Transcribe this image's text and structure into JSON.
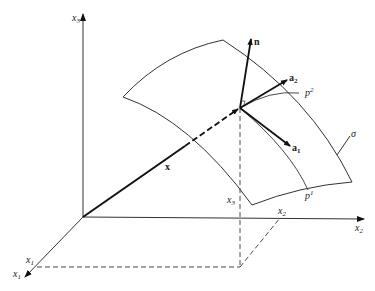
{
  "diagram": {
    "type": "surface-coordinate-geometry",
    "axes": {
      "x1": {
        "label": "x",
        "sub": "1"
      },
      "x2": {
        "label": "x",
        "sub": "2"
      },
      "x3": {
        "label": "x",
        "sub": "3"
      }
    },
    "projections": {
      "x1": {
        "label": "x",
        "sub": "1"
      },
      "x2": {
        "label": "x",
        "sub": "2"
      },
      "x3": {
        "label": "x",
        "sub": "3"
      }
    },
    "vectors": {
      "position": {
        "label": "x"
      },
      "normal": {
        "label": "n"
      },
      "tangent1": {
        "label": "a",
        "sub": "1"
      },
      "tangent2": {
        "label": "a",
        "sub": "2"
      }
    },
    "curves": {
      "p1": {
        "label": "p",
        "sup": "1"
      },
      "p2": {
        "label": "p",
        "sup": "2"
      }
    },
    "surface": {
      "label": "σ"
    }
  }
}
